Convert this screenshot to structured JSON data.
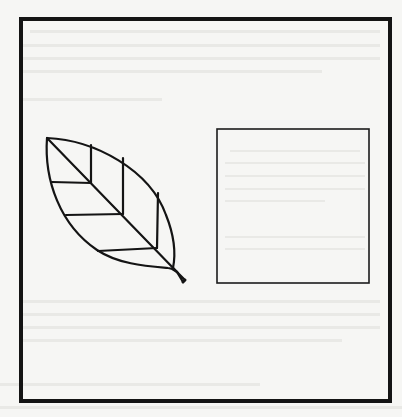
{
  "figure": {
    "frame": {
      "stroke": "#141414",
      "stroke_width": 4
    },
    "leaf": {
      "stroke": "#141414",
      "stroke_width": 2.2,
      "tip": [
        47,
        138
      ],
      "stem_end": [
        186,
        280
      ],
      "vein_joints": [
        {
          "joint": [
            91,
            182
          ],
          "up_to": [
            91,
            145
          ],
          "left_to": [
            52,
            182
          ]
        },
        {
          "joint": [
            123,
            213
          ],
          "up_to": [
            123,
            158
          ],
          "left_to": [
            66,
            215
          ]
        },
        {
          "joint": [
            157,
            247
          ],
          "up_to": [
            158,
            193
          ],
          "left_to": [
            98,
            250
          ]
        }
      ]
    },
    "square": {
      "x": 217,
      "y": 129,
      "width": 152,
      "height": 154,
      "stroke": "#1c1c1c",
      "stroke_width": 1.6
    },
    "paper_color": "#f6f6f4"
  }
}
